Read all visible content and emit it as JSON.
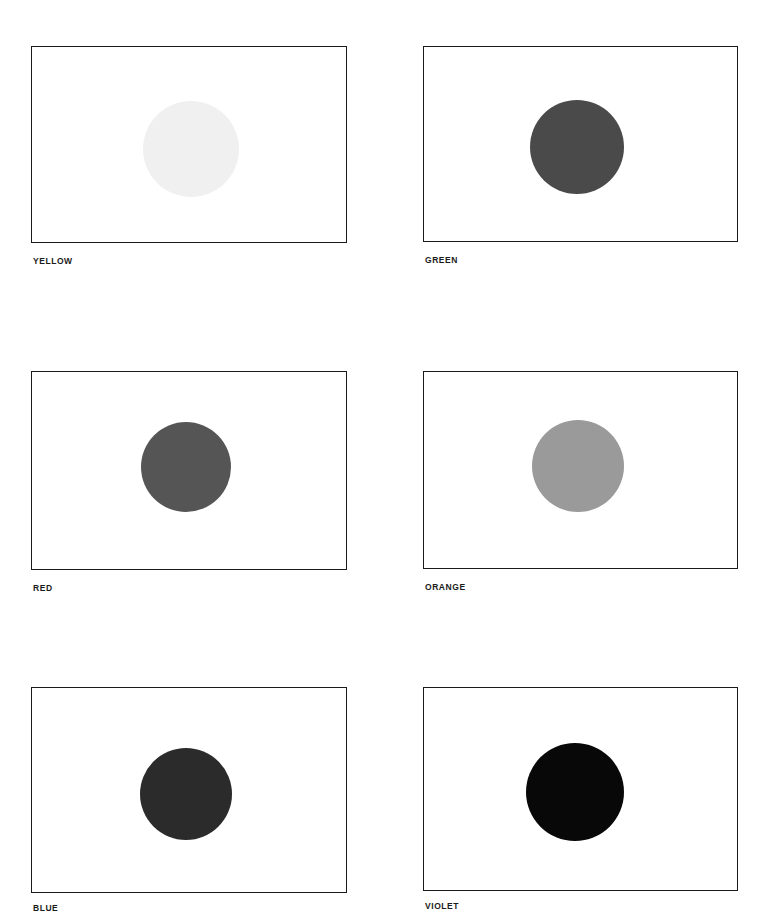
{
  "page": {
    "background_color": "#ffffff",
    "width": 772,
    "height": 912,
    "layout": "2-column x 3-row grid of bordered swatch panels, each containing one centered filled disc with a bold uppercase caption below the lower-left corner",
    "frame_border_color": "#1a1a1a",
    "label_color": "#1b1b1b"
  },
  "plates": [
    {
      "label": "YELLOW",
      "disc_color": "#f0f0f0",
      "frame": {
        "x": 31,
        "y": 46,
        "w": 316,
        "h": 197
      },
      "disc": {
        "cx": 190,
        "cy": 148,
        "d": 96
      },
      "label_pos": {
        "x": 33,
        "y": 256
      }
    },
    {
      "label": "GREEN",
      "disc_color": "#4a4a4a",
      "frame": {
        "x": 423,
        "y": 46,
        "w": 315,
        "h": 196
      },
      "disc": {
        "cx": 576,
        "cy": 146,
        "d": 94
      },
      "label_pos": {
        "x": 425,
        "y": 255
      }
    },
    {
      "label": "RED",
      "disc_color": "#555555",
      "frame": {
        "x": 31,
        "y": 371,
        "w": 316,
        "h": 199
      },
      "disc": {
        "cx": 185,
        "cy": 466,
        "d": 90
      },
      "label_pos": {
        "x": 33,
        "y": 583
      }
    },
    {
      "label": "ORANGE",
      "disc_color": "#9a9a9a",
      "frame": {
        "x": 423,
        "y": 371,
        "w": 315,
        "h": 198
      },
      "disc": {
        "cx": 577,
        "cy": 465,
        "d": 92
      },
      "label_pos": {
        "x": 425,
        "y": 582
      }
    },
    {
      "label": "BLUE",
      "disc_color": "#2b2b2b",
      "frame": {
        "x": 31,
        "y": 687,
        "w": 316,
        "h": 206
      },
      "disc": {
        "cx": 185,
        "cy": 793,
        "d": 92
      },
      "label_pos": {
        "x": 33,
        "y": 903
      }
    },
    {
      "label": "VIOLET",
      "disc_color": "#080808",
      "frame": {
        "x": 423,
        "y": 687,
        "w": 315,
        "h": 204
      },
      "disc": {
        "cx": 574,
        "cy": 791,
        "d": 98
      },
      "label_pos": {
        "x": 425,
        "y": 901
      }
    }
  ]
}
